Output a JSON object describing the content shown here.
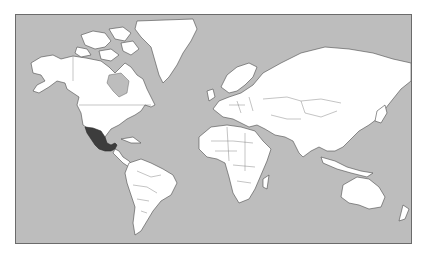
{
  "map": {
    "type": "world locator map",
    "projection": "Mercator",
    "highlighted_region": "Mexico",
    "colors": {
      "ocean": "#bdbdbd",
      "land": "#ffffff",
      "highlight": "#3d3d3d",
      "outline": "#4a4a4a",
      "frame": "#6b6b6b"
    }
  }
}
